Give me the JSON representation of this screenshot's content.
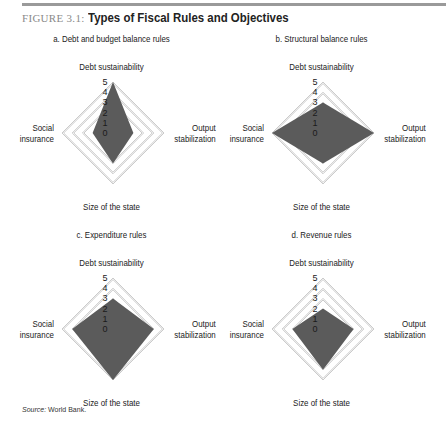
{
  "figure": {
    "number": "FIGURE 3.1:",
    "title": "Types of Fiscal Rules and Objectives",
    "source_label": "Source:",
    "source_text": "World Bank."
  },
  "colors": {
    "fill": "#5b5b5b",
    "grid": "#b4b4b4",
    "rule": "#9a9a9a"
  },
  "chart_data": [
    {
      "type": "radar",
      "title": "a. Debt and budget balance rules",
      "axes": [
        "Debt sustainability",
        "Output stabilization",
        "Size of the state",
        "Social insurance"
      ],
      "ticks": [
        0,
        1,
        2,
        3,
        4,
        5
      ],
      "range": [
        0,
        5
      ],
      "values": [
        5,
        2,
        3,
        2
      ]
    },
    {
      "type": "radar",
      "title": "b. Structural balance rules",
      "axes": [
        "Debt sustainability",
        "Output stabilization",
        "Size of the state",
        "Social insurance"
      ],
      "ticks": [
        0,
        1,
        2,
        3,
        4,
        5
      ],
      "range": [
        0,
        5
      ],
      "values": [
        3,
        5,
        3,
        5
      ]
    },
    {
      "type": "radar",
      "title": "c. Expenditure rules",
      "axes": [
        "Debt sustainability",
        "Output stabilization",
        "Size of the state",
        "Social insurance"
      ],
      "ticks": [
        0,
        1,
        2,
        3,
        4,
        5
      ],
      "range": [
        0,
        5
      ],
      "values": [
        3,
        4,
        5,
        4
      ]
    },
    {
      "type": "radar",
      "title": "d. Revenue rules",
      "axes": [
        "Debt sustainability",
        "Output stabilization",
        "Size of the state",
        "Social insurance"
      ],
      "ticks": [
        0,
        1,
        2,
        3,
        4,
        5
      ],
      "range": [
        0,
        5
      ],
      "values": [
        2,
        3,
        4,
        3
      ]
    }
  ],
  "axis_labels": {
    "top": "Debt sustainability",
    "right_line1": "Output",
    "right_line2": "stabilization",
    "bottom": "Size of the state",
    "left_line1": "Social",
    "left_line2": "insurance"
  }
}
